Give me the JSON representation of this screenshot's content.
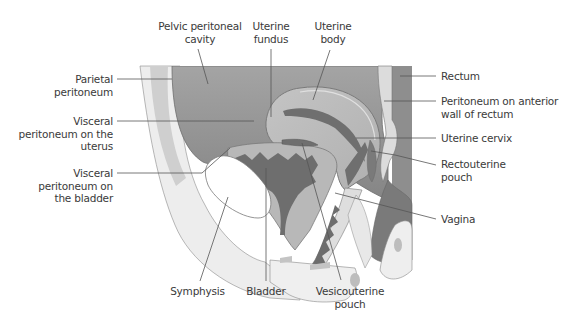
{
  "figure": {
    "type": "anatomical-diagram",
    "colors": {
      "background": "#ffffff",
      "cavity_dark": "#8c8c8c",
      "cavity_gradient_light": "#a9a9a9",
      "organ_mid": "#b4b4b4",
      "organ_light": "#c9c9c9",
      "tissue_pale": "#e6e6e6",
      "bone_white": "#fbfbfb",
      "lumen_dark": "#6e6e6e",
      "leader_line": "#555555",
      "label_text": "#3a3a3a"
    }
  },
  "labels": {
    "left": [
      {
        "id": "parietal-peritoneum",
        "text": "Parietal\nperitoneum"
      },
      {
        "id": "visceral-peritoneum-uterus",
        "text": "Visceral\nperitoneum on the\nuterus"
      },
      {
        "id": "visceral-peritoneum-bladder",
        "text": "Visceral\nperitoneum on\nthe bladder"
      }
    ],
    "top": [
      {
        "id": "pelvic-peritoneal-cavity",
        "text": "Pelvic peritoneal\ncavity"
      },
      {
        "id": "uterine-fundus",
        "text": "Uterine\nfundus"
      },
      {
        "id": "uterine-body",
        "text": "Uterine\nbody"
      }
    ],
    "right": [
      {
        "id": "rectum",
        "text": "Rectum"
      },
      {
        "id": "peritoneum-anterior-wall-rectum",
        "text": "Peritoneum on anterior\nwall of rectum"
      },
      {
        "id": "uterine-cervix",
        "text": "Uterine cervix"
      },
      {
        "id": "rectouterine-pouch",
        "text": "Rectouterine\npouch"
      },
      {
        "id": "vagina",
        "text": "Vagina"
      }
    ],
    "bottom": [
      {
        "id": "symphysis",
        "text": "Symphysis"
      },
      {
        "id": "bladder",
        "text": "Bladder"
      },
      {
        "id": "vesicouterine-pouch",
        "text": "Vesicouterine\npouch"
      }
    ]
  }
}
